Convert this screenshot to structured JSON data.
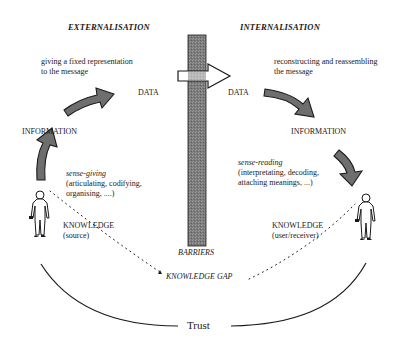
{
  "diagram": {
    "headings": {
      "left": "EXTERNALISATION",
      "right": "INTERNALISATION"
    },
    "left": {
      "top_caption_line1": "giving a fixed representation",
      "top_caption_line2": "to the message",
      "data_label": "DATA",
      "information_label": "INFORMATION",
      "process_title": "sense-giving",
      "process_line1": "(articulating, codifying,",
      "process_line2": "organising, ....)",
      "knowledge_label": "KNOWLEDGE",
      "knowledge_sub": "(source)"
    },
    "right": {
      "top_caption_line1": "reconstructing and reassembling",
      "top_caption_line2": "the message",
      "data_label": "DATA",
      "information_label": "INFORMATION",
      "process_title": "sense-reading",
      "process_line1": "(interpretating, decoding,",
      "process_line2": "attaching meanings, ...)",
      "knowledge_label": "KNOWLEDGE",
      "knowledge_sub": "(user/receiver)"
    },
    "barrier_label": "BARRIERS",
    "gap_label": "KNOWLEDGE GAP",
    "trust_label": "Trust",
    "colors": {
      "barrier_fill": "#7a7a7a",
      "arrow_fill": "#6e6e6e",
      "stroke": "#1a1a1a"
    }
  }
}
